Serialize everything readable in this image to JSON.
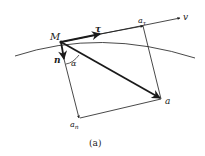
{
  "diagram": {
    "type": "vector-decomposition",
    "caption": "(a)",
    "labels": {
      "point": "M",
      "tangent_unit": "τ",
      "normal_unit": "n",
      "velocity": "v",
      "tangential_accel": "aτ",
      "tangential_accel_base": "a",
      "tangential_accel_sub": "τ",
      "normal_accel_base": "a",
      "normal_accel_sub": "n",
      "total_accel": "a",
      "angle": "α"
    },
    "colors": {
      "stroke": "#1a1a1a",
      "background": "#ffffff"
    }
  }
}
